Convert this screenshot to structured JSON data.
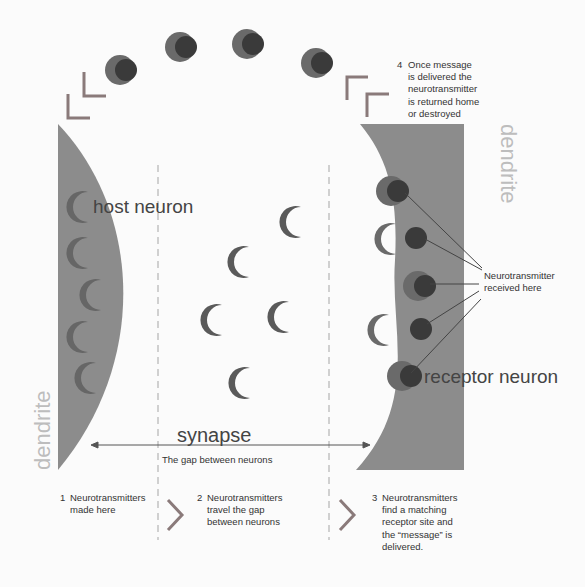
{
  "diagram": {
    "labels": {
      "host_neuron": "host neuron",
      "receptor_neuron": "receptor neuron",
      "dendrite_left": "dendrite",
      "dendrite_right": "dendrite",
      "synapse": "synapse",
      "synapse_caption": "The gap between neurons",
      "received_callout": "Neurotransmitter\nreceived here"
    },
    "steps": [
      {
        "number": "1",
        "text": "Neurotransmitters\nmade here"
      },
      {
        "number": "2",
        "text": "Neurotransmitters\ntravel the gap\nbetween neurons"
      },
      {
        "number": "3",
        "text": "Neurotransmitters\nfind a matching\nreceptor site and\nthe “message” is\ndelivered."
      },
      {
        "number": "4",
        "text": "Once message\nis delivered the\nneurotransmitter\nis returned home\nor destroyed"
      }
    ],
    "colors": {
      "neuron_fill": "#8c8c8c",
      "neurotransmitter": "#5a5a5a",
      "receptor_dark": "#3a3a3a",
      "dendrite_text": "#bdbdbd",
      "divider": "#d0d0d0",
      "chevron": "#7a7a7a",
      "text": "#333333"
    }
  }
}
